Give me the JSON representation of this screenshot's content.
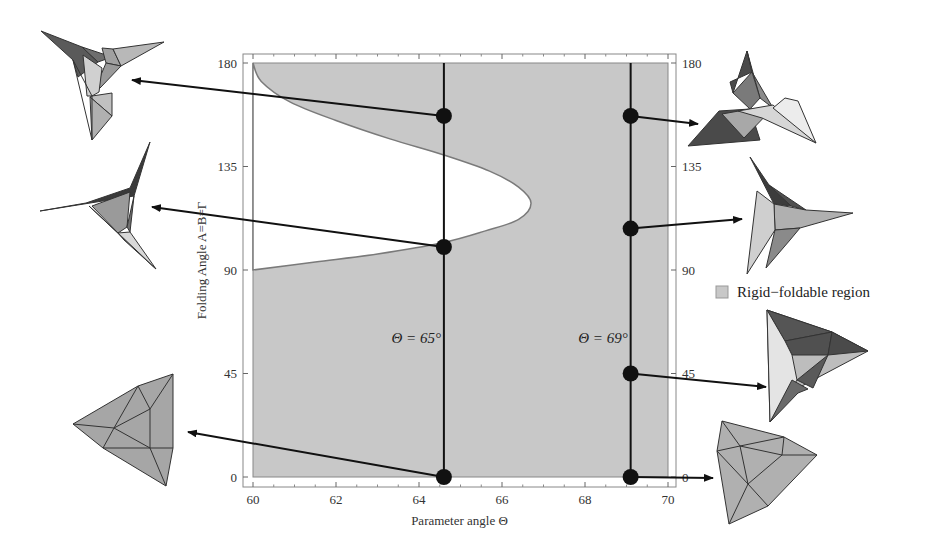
{
  "chart_data": {
    "type": "area",
    "title": "",
    "xlabel": "Parameter angle Θ",
    "ylabel": "Folding Angle A=B=Γ",
    "xlim": [
      60,
      70
    ],
    "ylim": [
      0,
      180
    ],
    "x_ticks": [
      60,
      62,
      64,
      66,
      68,
      70
    ],
    "y_ticks": [
      0,
      45,
      90,
      135,
      180
    ],
    "grid": false,
    "legend": {
      "position": "right",
      "entries": [
        {
          "label": "Rigid−foldable region",
          "color": "#c8c8c8"
        }
      ]
    },
    "colors": {
      "region": "#c8c8c8",
      "boundary": "#7a7a7a",
      "line": "#111111",
      "frame": "#888888"
    },
    "excluded_region_boundary": {
      "description": "non-foldable (white) lobe; rigid-foldable elsewhere",
      "points": [
        [
          60.0,
          180
        ],
        [
          60.2,
          172
        ],
        [
          60.9,
          163
        ],
        [
          62.0,
          155
        ],
        [
          63.3,
          147
        ],
        [
          64.6,
          140
        ],
        [
          65.7,
          133
        ],
        [
          66.4,
          126
        ],
        [
          66.7,
          119
        ],
        [
          66.4,
          112
        ],
        [
          65.6,
          107
        ],
        [
          64.6,
          102
        ],
        [
          63.0,
          97
        ],
        [
          61.5,
          93.5
        ],
        [
          60.0,
          90
        ]
      ]
    },
    "vertical_lines": [
      {
        "theta": 64.6,
        "label": "Θ = 65°",
        "label_y": 60
      },
      {
        "theta": 69.1,
        "label": "Θ = 69°",
        "label_y": 60
      }
    ],
    "series": [
      {
        "name": "Θ = 65° states",
        "points": [
          [
            64.6,
            157
          ],
          [
            64.6,
            100
          ],
          [
            64.6,
            0
          ]
        ]
      },
      {
        "name": "Θ = 69° states",
        "points": [
          [
            69.1,
            157
          ],
          [
            69.1,
            108
          ],
          [
            69.1,
            45
          ],
          [
            69.1,
            0
          ]
        ]
      }
    ],
    "insets": [
      {
        "name": "fold-65-157",
        "side": "left",
        "state": [
          64.6,
          157
        ]
      },
      {
        "name": "fold-65-100",
        "side": "left",
        "state": [
          64.6,
          100
        ]
      },
      {
        "name": "fold-65-0",
        "side": "left",
        "state": [
          64.6,
          0
        ]
      },
      {
        "name": "fold-69-157",
        "side": "right",
        "state": [
          69.1,
          157
        ]
      },
      {
        "name": "fold-69-108",
        "side": "right",
        "state": [
          69.1,
          108
        ]
      },
      {
        "name": "fold-69-45",
        "side": "right",
        "state": [
          69.1,
          45
        ]
      },
      {
        "name": "fold-69-0",
        "side": "right",
        "state": [
          69.1,
          0
        ]
      }
    ]
  }
}
